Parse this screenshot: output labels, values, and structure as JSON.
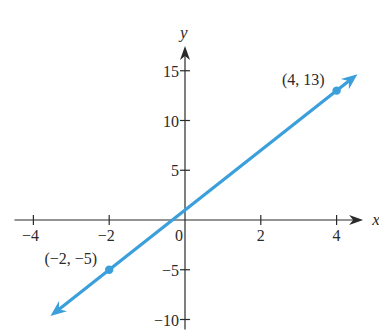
{
  "chart_data": {
    "type": "line",
    "title": "",
    "xlabel": "x",
    "ylabel": "y",
    "xlim": [
      -4.5,
      4.7
    ],
    "ylim": [
      -11,
      17.5
    ],
    "x_ticks": [
      -4,
      -2,
      0,
      2,
      4
    ],
    "x_tick_labels": [
      "−4",
      "−2",
      "0",
      "2",
      "4"
    ],
    "y_ticks": [
      15,
      10,
      5,
      -5,
      -10
    ],
    "y_tick_labels": [
      "15",
      "10",
      "5",
      "−5",
      "−10"
    ],
    "grid": false,
    "legend": null,
    "series": [
      {
        "name": "line",
        "equation": "y = 3x + 1",
        "color": "#3b9fdc",
        "x": [
          -2,
          4
        ],
        "y": [
          -5,
          13
        ],
        "arrows_both_ends": true
      }
    ],
    "annotations": [
      {
        "label": "(4, 13)",
        "x": 4,
        "y": 13
      },
      {
        "label": "(−2, −5)",
        "x": -2,
        "y": -5
      }
    ]
  },
  "colors": {
    "line": "#3b9fdc",
    "axes": "#2a2a2a",
    "background": "#ffffff"
  }
}
